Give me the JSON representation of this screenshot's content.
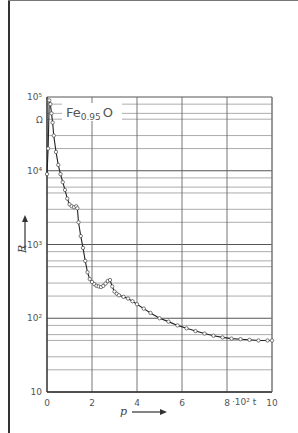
{
  "chart_data": {
    "type": "line",
    "title": "",
    "series": [
      {
        "name": "Fe0.95O",
        "marker": "open-circle",
        "x": [
          0.0,
          0.05,
          0.1,
          0.15,
          0.2,
          0.25,
          0.3,
          0.4,
          0.5,
          0.6,
          0.7,
          0.8,
          0.9,
          1.0,
          1.1,
          1.2,
          1.3,
          1.35,
          1.4,
          1.5,
          1.6,
          1.7,
          1.8,
          1.9,
          2.0,
          2.1,
          2.2,
          2.3,
          2.4,
          2.5,
          2.6,
          2.7,
          2.8,
          2.9,
          3.0,
          3.1,
          3.2,
          3.4,
          3.6,
          3.8,
          4.0,
          4.3,
          4.6,
          5.0,
          5.4,
          5.8,
          6.2,
          6.6,
          7.0,
          7.4,
          7.8,
          8.2,
          8.6,
          9.0,
          9.4,
          9.8,
          10.0
        ],
        "values": [
          9000,
          20000,
          90000,
          80000,
          60000,
          45000,
          30000,
          18000,
          12000,
          9000,
          7000,
          5500,
          4200,
          3500,
          3300,
          3200,
          3300,
          3100,
          2000,
          1300,
          900,
          600,
          420,
          340,
          310,
          290,
          275,
          270,
          265,
          275,
          295,
          320,
          330,
          270,
          230,
          215,
          205,
          195,
          185,
          170,
          155,
          135,
          118,
          100,
          90,
          80,
          73,
          67,
          62,
          58,
          55,
          53,
          52,
          51,
          50,
          50,
          50
        ]
      }
    ],
    "xlabel": "p",
    "ylabel": "R",
    "y_unit": "Ω",
    "x_extra_label": "·10² t",
    "xlim": [
      0,
      10
    ],
    "ylim": [
      10,
      100000
    ],
    "yscale": "log",
    "x_ticks": [
      "0",
      "2",
      "4",
      "6",
      "8",
      "10"
    ],
    "y_ticks": [
      "10",
      "10²",
      "10³",
      "10⁴",
      "10⁵"
    ],
    "grid": true,
    "legend": {
      "text": "Fe",
      "subscript": "0.95",
      "suffix": "O",
      "position": "top-left"
    }
  }
}
